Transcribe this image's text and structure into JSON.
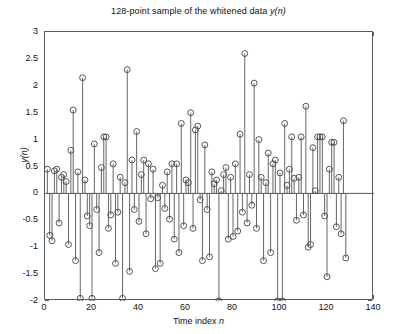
{
  "chart_data": {
    "type": "stem",
    "title": "128-point sample of the whitened data y(n)",
    "title_plain": "128-point sample of the whitened data ",
    "title_italic": "y(n)",
    "xlabel": "Time index n",
    "xlabel_plain": "Time index ",
    "xlabel_italic": "n",
    "ylabel": "y(n)",
    "xlim": [
      0,
      140
    ],
    "ylim": [
      -2,
      3
    ],
    "xticks": [
      0,
      20,
      40,
      60,
      80,
      100,
      120,
      140
    ],
    "yticks": [
      -2,
      -1.5,
      -1,
      -0.5,
      0,
      0.5,
      1,
      1.5,
      2,
      2.5,
      3
    ],
    "ytick_labels": [
      "-2",
      "-1.5",
      "-1",
      "-0.5",
      "0",
      "0.5",
      "1",
      "1.5",
      "2",
      "2.5",
      "3"
    ],
    "xtick_labels": [
      "0",
      "20",
      "40",
      "60",
      "80",
      "100",
      "120",
      "140"
    ],
    "grid": false,
    "legend": false,
    "marker": "circle-open",
    "marker_size": 4,
    "line_color": "#555555",
    "marker_color": "#444444",
    "baseline": 0,
    "n_points": 128,
    "x": [
      1,
      2,
      3,
      4,
      5,
      6,
      7,
      8,
      9,
      10,
      11,
      12,
      13,
      14,
      15,
      16,
      17,
      18,
      19,
      20,
      21,
      22,
      23,
      24,
      25,
      26,
      27,
      28,
      29,
      30,
      31,
      32,
      33,
      34,
      35,
      36,
      37,
      38,
      39,
      40,
      41,
      42,
      43,
      44,
      45,
      46,
      47,
      48,
      49,
      50,
      51,
      52,
      53,
      54,
      55,
      56,
      57,
      58,
      59,
      60,
      61,
      62,
      63,
      64,
      65,
      66,
      67,
      68,
      69,
      70,
      71,
      72,
      73,
      74,
      75,
      76,
      77,
      78,
      79,
      80,
      81,
      82,
      83,
      84,
      85,
      86,
      87,
      88,
      89,
      90,
      91,
      92,
      93,
      94,
      95,
      96,
      97,
      98,
      99,
      100,
      101,
      102,
      103,
      104,
      105,
      106,
      107,
      108,
      109,
      110,
      111,
      112,
      113,
      114,
      115,
      116,
      117,
      118,
      119,
      120,
      121,
      122,
      123,
      124,
      125,
      126,
      127,
      128
    ],
    "values": [
      0.45,
      -0.78,
      -0.88,
      0.42,
      0.45,
      -0.55,
      0.3,
      0.35,
      0.22,
      -0.95,
      0.8,
      1.55,
      -1.25,
      0.4,
      -1.95,
      2.15,
      0.25,
      -0.42,
      -0.6,
      -1.95,
      0.92,
      -0.3,
      -1.1,
      0.48,
      1.05,
      1.05,
      -0.65,
      -0.4,
      0.55,
      -1.3,
      -0.35,
      0.3,
      -1.95,
      0.2,
      2.3,
      -1.45,
      0.62,
      -0.3,
      1.15,
      -0.52,
      0.35,
      0.62,
      -0.75,
      0.55,
      -0.1,
      0.45,
      -1.4,
      -0.08,
      -1.3,
      0.15,
      -0.28,
      0.4,
      -0.48,
      0.55,
      -0.85,
      0.55,
      -1.1,
      1.3,
      -0.6,
      0.25,
      0.2,
      1.5,
      -0.65,
      1.18,
      1.25,
      -0.12,
      -1.25,
      0.9,
      -0.3,
      -1.18,
      0.4,
      0.18,
      0.25,
      -2.0,
      0.05,
      0.35,
      0.48,
      -0.85,
      0.3,
      -0.8,
      0.55,
      -0.7,
      1.1,
      -0.35,
      2.6,
      -0.55,
      0.35,
      -0.22,
      2.05,
      -0.65,
      1.0,
      0.3,
      -1.25,
      0.2,
      0.75,
      -1.1,
      0.55,
      0.62,
      -2.0,
      0.38,
      -2.0,
      1.3,
      0.15,
      0.45,
      1.05,
      0.28,
      -0.5,
      0.3,
      1.05,
      -0.4,
      1.62,
      -1.0,
      -0.95,
      0.85,
      0.05,
      1.05,
      1.05,
      1.05,
      -0.42,
      -1.55,
      0.45,
      0.95,
      0.95,
      -0.62,
      0.3,
      -0.75,
      1.35,
      -1.2
    ]
  }
}
